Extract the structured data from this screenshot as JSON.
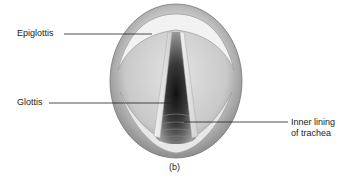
{
  "figure": {
    "caption": "(b)"
  },
  "labels": [
    {
      "id": "epiglottis",
      "text": "Epiglottis"
    },
    {
      "id": "glottis",
      "text": "Glottis"
    },
    {
      "id": "inner-lining",
      "line1": "Inner lining",
      "line2": "of trachea"
    }
  ]
}
